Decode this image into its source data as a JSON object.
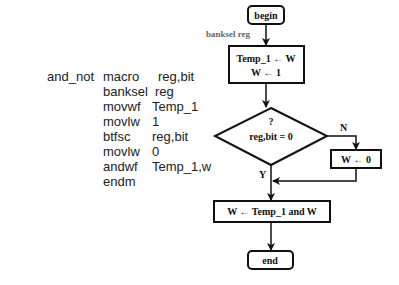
{
  "code": {
    "label": "and_not",
    "lines": [
      {
        "op": "macro",
        "arg": "reg,bit"
      },
      {
        "op": "banksel",
        "arg": "reg"
      },
      {
        "op": "movwf",
        "arg": "Temp_1"
      },
      {
        "op": "movlw",
        "arg": "1"
      },
      {
        "op": "btfsc",
        "arg": "reg,bit"
      },
      {
        "op": "movlw",
        "arg": "0"
      },
      {
        "op": "andwf",
        "arg": "Temp_1,w"
      },
      {
        "op": "endm",
        "arg": ""
      }
    ]
  },
  "flowchart": {
    "begin": "begin",
    "banksel_label": "banksel reg",
    "box1_line1": "Temp_1 ← W",
    "box1_line2": "W ← 1",
    "decision_q": "?",
    "decision_cond": "reg,bit = 0",
    "no_label": "N",
    "yes_label": "Y",
    "box_no": "W ← 0",
    "box3": "W ← Temp_1 and W",
    "end": "end"
  }
}
